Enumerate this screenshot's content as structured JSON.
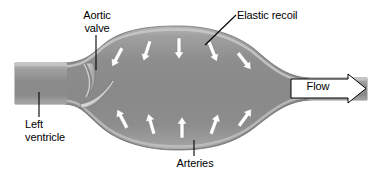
{
  "figure": {
    "background_color": "#ffffff"
  },
  "labels": {
    "aortic_valve": "Aortic\nvalve",
    "elastic_recoil": "Elastic recoil",
    "left_ventricle": "Left\nventricle",
    "arteries": "Arteries",
    "flow": "Flow"
  },
  "colors": {
    "vessel_fill": "#8e8e8e",
    "vessel_fill_light": "#a6a6a6",
    "vessel_fill_dark": "#7a7a7a",
    "wall_highlight": "#c4c4c4",
    "wall_edge": "#6f6f6f",
    "arrow_white": "#ffffff",
    "arrow_outline": "#5a5a5a",
    "leader_line": "#000000",
    "text": "#000000",
    "flow_arrow_fill": "#ffffff",
    "flow_arrow_stroke": "#000000"
  },
  "recoil_arrows": {
    "count_top": 5,
    "count_bottom": 5,
    "direction_top": "inward-downward",
    "direction_bottom": "inward-upward",
    "color": "#ffffff"
  },
  "anatomy": {
    "left_tube": "left ventricle outflow tract",
    "neck": "aortic valve",
    "bulge": "distended elastic artery",
    "right_tube": "downstream arteries"
  }
}
